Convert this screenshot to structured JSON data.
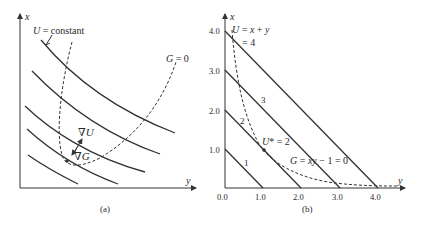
{
  "panel_a": {
    "caption": "(a)",
    "axis_x_label": "y",
    "axis_vertical_label": "x",
    "u_label": "U = constant",
    "g_label": "G = 0",
    "grad_u_label": "∇U",
    "grad_g_label": "∇G"
  },
  "panel_b": {
    "caption": "(b)",
    "axis_x_label": "y",
    "axis_vertical_label": "x",
    "x_ticks": [
      "0.0",
      "1.0",
      "2.0",
      "3.0",
      "4.0"
    ],
    "y_ticks": [
      "1.0",
      "2.0",
      "3.0",
      "4.0"
    ],
    "u_label_line1": "U = x + y",
    "u_label_line2": "= 4",
    "level_labels": [
      "1",
      "2",
      "3"
    ],
    "optimum_label": "U* = 2",
    "g_label": "G = xy − 1 = 0"
  },
  "colors": {
    "line": "#333333",
    "background": "#ffffff"
  }
}
